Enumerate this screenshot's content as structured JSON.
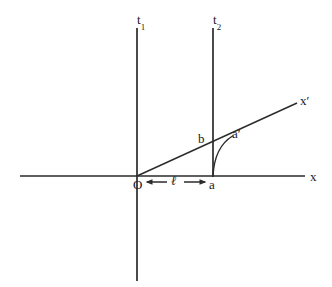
{
  "figure": {
    "background_color": "#ffffff",
    "stroke_color": "#2b2b2b",
    "width": 332,
    "height": 287
  },
  "axes": {
    "t1": {
      "label": "t",
      "subscript": "1",
      "x": 137,
      "y_top": 28,
      "y_bottom": 281
    },
    "t2": {
      "label": "t",
      "subscript": "2",
      "x": 213,
      "y_top": 28,
      "y_bottom": 176
    },
    "x": {
      "label": "x",
      "y": 176,
      "x_left": 20,
      "x_right": 305
    },
    "xprime": {
      "label": "x′",
      "x_start": 137,
      "y_start": 176,
      "x_end": 297,
      "y_end": 103
    }
  },
  "points": {
    "origin": {
      "label": "O",
      "x": 137,
      "y": 176
    },
    "a": {
      "label": "a",
      "x": 213,
      "y": 176
    },
    "b": {
      "label": "b",
      "x": 213,
      "y": 141
    },
    "a_prime": {
      "label": "a′",
      "x": 233,
      "y": 139
    }
  },
  "measure": {
    "label": "ℓ",
    "from_point": "O",
    "to_point": "a",
    "arrow_left_x": 147,
    "arrow_right_x": 205,
    "y": 182
  },
  "curve": {
    "name": "worldline-arc-a-to-a-prime",
    "from": {
      "x": 213,
      "y": 176
    },
    "to": {
      "x": 232,
      "y": 136
    },
    "control": {
      "x": 214,
      "y": 148
    }
  }
}
